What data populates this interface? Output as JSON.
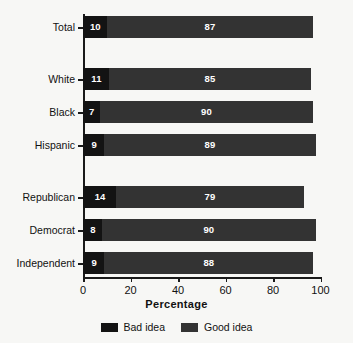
{
  "chart_data": {
    "type": "bar",
    "orientation": "horizontal",
    "stacked": true,
    "title": "",
    "xlabel": "Percentage",
    "ylabel": "",
    "xlim": [
      0,
      100
    ],
    "xticks": [
      0,
      20,
      40,
      60,
      80,
      100
    ],
    "grid": false,
    "legend_position": "bottom",
    "categories": [
      "Total",
      "White",
      "Black",
      "Hispanic",
      "Republican",
      "Democrat",
      "Independent"
    ],
    "series": [
      {
        "name": "Bad idea",
        "color": "#131313",
        "values": [
          10,
          11,
          7,
          9,
          14,
          8,
          9
        ]
      },
      {
        "name": "Good idea",
        "color": "#333333",
        "values": [
          87,
          85,
          90,
          89,
          79,
          90,
          88
        ]
      }
    ],
    "group_breaks_after": [
      "Total",
      "Hispanic"
    ]
  },
  "legend": {
    "items": [
      {
        "label": "Bad idea",
        "color": "#131313"
      },
      {
        "label": "Good idea",
        "color": "#333333"
      }
    ]
  }
}
